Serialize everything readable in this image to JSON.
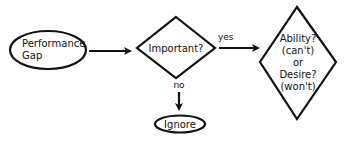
{
  "diagram": {
    "type": "flowchart",
    "colors": {
      "stroke": "#111111",
      "fill": "#ffffff",
      "background": "#ffffff"
    },
    "nodes": {
      "start": {
        "shape": "ellipse",
        "lines": [
          "Performance",
          "Gap"
        ]
      },
      "decision1": {
        "shape": "diamond",
        "lines": [
          "Important?"
        ]
      },
      "decision2": {
        "shape": "diamond",
        "lines": [
          "Ability?",
          "(can't)",
          "or",
          "Desire?",
          "(won't)"
        ]
      },
      "end_ignore": {
        "shape": "ellipse",
        "lines": [
          "Ignore"
        ]
      }
    },
    "edges": [
      {
        "from": "start",
        "to": "decision1",
        "label": ""
      },
      {
        "from": "decision1",
        "to": "decision2",
        "label": "yes"
      },
      {
        "from": "decision1",
        "to": "end_ignore",
        "label": "no"
      }
    ]
  }
}
